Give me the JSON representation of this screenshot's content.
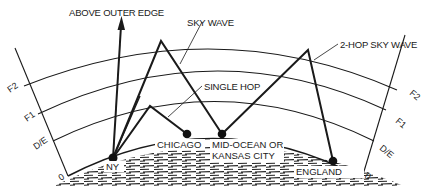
{
  "diagram": {
    "type": "ionospheric-propagation",
    "labels": {
      "above_outer_edge": "ABOVE OUTER EDGE",
      "sky_wave": "SKY WAVE",
      "two_hop_sky_wave": "2-HOP SKY WAVE",
      "single_hop": "SINGLE HOP"
    },
    "layers_left": [
      "F2",
      "F1",
      "D/E",
      "0"
    ],
    "layers_right": [
      "F2",
      "F1",
      "D/E",
      "0"
    ],
    "locations": {
      "ny": "NY",
      "chicago": "CHICAGO",
      "mid_ocean_line1": "MID-OCEAN OR",
      "mid_ocean_line2": "KANSAS CITY",
      "england": "ENGLAND"
    },
    "colors": {
      "ink": "#1a1a1a",
      "background": "#ffffff"
    }
  }
}
